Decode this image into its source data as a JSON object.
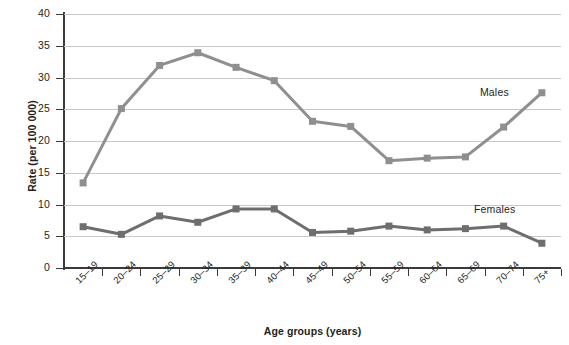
{
  "chart_data": {
    "type": "line",
    "title": "",
    "xlabel": "Age groups (years)",
    "ylabel": "Rate (per 100 000)",
    "categories": [
      "15–19",
      "20–24",
      "25–29",
      "30–34",
      "35–39",
      "40–44",
      "45–49",
      "50–54",
      "55–59",
      "60–64",
      "65–69",
      "70–74",
      "75+"
    ],
    "ylim": [
      0,
      40
    ],
    "yticks": [
      0,
      5,
      10,
      15,
      20,
      25,
      30,
      35,
      40
    ],
    "ytick_labels": [
      "0",
      "5",
      "10",
      "15",
      "20",
      "25",
      "30",
      "35",
      "40"
    ],
    "grid": true,
    "legend_position": "inline-right",
    "series": [
      {
        "name": "Males",
        "color": "#8f8f8f",
        "marker": "square",
        "values": [
          13.4,
          25.1,
          31.9,
          33.9,
          31.6,
          29.5,
          23.1,
          22.3,
          16.9,
          17.3,
          17.5,
          22.2,
          27.6
        ]
      },
      {
        "name": "Females",
        "color": "#6e6e6e",
        "marker": "square",
        "values": [
          6.5,
          5.3,
          8.2,
          7.2,
          9.3,
          9.3,
          5.6,
          5.8,
          6.6,
          6.0,
          6.2,
          6.6,
          3.9
        ]
      }
    ],
    "annotations": [
      {
        "text": "Males",
        "series": "Males"
      },
      {
        "text": "Females",
        "series": "Females"
      }
    ]
  },
  "colors": {
    "axis": "#3a3a3a",
    "grid": "#c9c9c9",
    "background": "#ffffff",
    "text": "#231f20"
  }
}
